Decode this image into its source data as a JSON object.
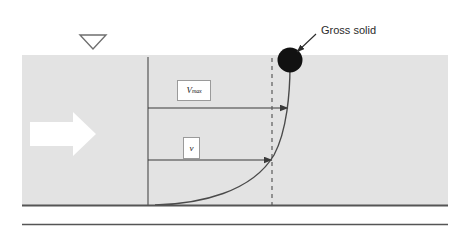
{
  "figure": {
    "type": "hydraulic-velocity-profile-diagram",
    "colors": {
      "water_fill": "#e3e3e3",
      "line": "#4a4a4a",
      "bed_line": "#555555",
      "solid_fill": "#111111",
      "arrow_fill": "#ffffff",
      "label_text": "#2b2b2b",
      "box_border": "#9a9a9a"
    }
  },
  "annotations": {
    "gross_solid_label": "Gross solid",
    "velocity_max_symbol": "V",
    "velocity_max_subscript": "max",
    "velocity_symbol": "v"
  },
  "icons": {
    "water_surface_symbol": "inverted-triangle",
    "flow_direction_symbol": "right-block-arrow",
    "solid_particle_symbol": "filled-circle"
  }
}
